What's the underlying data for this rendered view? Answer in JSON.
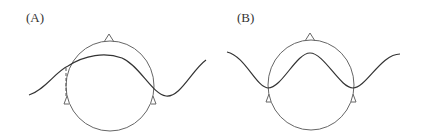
{
  "panels": [
    {
      "label": "(A)",
      "description": "Head diagram with traveling wave crossing; wave peak inside head; dashed vertical line at left ear",
      "head": {
        "cx": 110,
        "cy": 86,
        "rx": 44,
        "ry": 45
      },
      "wave_path": "M29,95 C45,90 55,72 68,66 C85,55 105,52 122,58 C140,66 152,94 166,96 C180,98 192,70 206,60",
      "dashed_line": {
        "x": 66,
        "y1": 68,
        "y2": 97
      },
      "ears": [
        {
          "x": 66,
          "y": 97
        },
        {
          "x": 154,
          "y": 97
        }
      ],
      "nose": {
        "x": 109,
        "y": 41
      }
    },
    {
      "label": "(B)",
      "description": "Head diagram with standing-wave-like curve; troughs at both ears, peak at nose",
      "head": {
        "cx": 311,
        "cy": 85,
        "rx": 43,
        "ry": 45
      },
      "wave_path": "M227,52 C245,56 256,87 268,88 C282,88 296,53 310,53 C324,53 340,88 353,88 C366,88 381,54 400,54",
      "ears": [
        {
          "x": 268,
          "y": 95
        },
        {
          "x": 354,
          "y": 95
        }
      ],
      "nose": {
        "x": 310,
        "y": 40
      }
    }
  ],
  "colors": {
    "stroke": "#555555",
    "wave": "#333333"
  }
}
